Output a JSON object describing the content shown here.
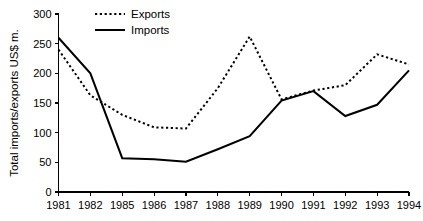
{
  "chart_data": {
    "type": "line",
    "title": "",
    "xlabel": "",
    "ylabel": "Total imports/exports US$ m.",
    "categories": [
      "1981",
      "1982",
      "1985",
      "1986",
      "1987",
      "1988",
      "1989",
      "1990",
      "1991",
      "1992",
      "1993",
      "1994"
    ],
    "series": [
      {
        "name": "Exports",
        "style": "dotted",
        "color": "#000000",
        "values": [
          240,
          163,
          130,
          109,
          107,
          175,
          262,
          156,
          171,
          180,
          232,
          215
        ]
      },
      {
        "name": "Imports",
        "style": "solid",
        "color": "#000000",
        "values": [
          260,
          200,
          57,
          55,
          51,
          72,
          94,
          154,
          170,
          128,
          147,
          205
        ]
      }
    ],
    "yticks": [
      0,
      50,
      100,
      150,
      200,
      250,
      300
    ],
    "ylim": [
      0,
      300
    ],
    "xtick_labels": [
      "1981",
      "1982",
      "1985",
      "1986",
      "1987",
      "1988",
      "1989",
      "1990",
      "1991",
      "1992",
      "1993",
      "1994"
    ],
    "grid": false,
    "legend_position": "top-left-inside",
    "legend": [
      {
        "label": "Exports",
        "style": "dotted"
      },
      {
        "label": "Imports",
        "style": "solid"
      }
    ]
  },
  "legend": {
    "exports_label": "Exports",
    "imports_label": "Imports"
  },
  "axes": {
    "y_title": "Total imports/exports US$ m."
  }
}
